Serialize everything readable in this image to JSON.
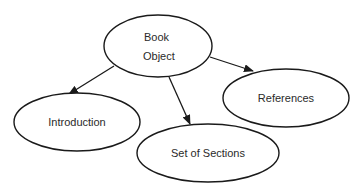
{
  "diagram": {
    "nodes": [
      {
        "id": "book",
        "lines": [
          "Book",
          "Object"
        ],
        "cx": 158,
        "cy": 46,
        "rx": 54,
        "ry": 31
      },
      {
        "id": "intro",
        "lines": [
          "Introduction"
        ],
        "cx": 77,
        "cy": 122,
        "rx": 63,
        "ry": 29
      },
      {
        "id": "sections",
        "lines": [
          "Set of Sections"
        ],
        "cx": 208,
        "cy": 153,
        "rx": 71,
        "ry": 29
      },
      {
        "id": "refs",
        "lines": [
          "References"
        ],
        "cx": 286,
        "cy": 98,
        "rx": 63,
        "ry": 29
      }
    ],
    "edges": [
      {
        "from": "book",
        "to": "intro"
      },
      {
        "from": "book",
        "to": "sections"
      },
      {
        "from": "book",
        "to": "refs"
      }
    ]
  }
}
